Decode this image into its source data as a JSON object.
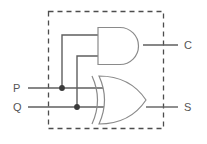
{
  "diagram": {
    "boundary": {
      "style": "dashed",
      "color": "#4d4d4d",
      "x": 48,
      "y": 11,
      "width": 115,
      "height": 117
    },
    "colors": {
      "wire": "#5f5f5f",
      "gate_outline": "#8a8a8a",
      "boundary": "#4d4d4d",
      "junction": "#3a3a3a",
      "label": "#555555",
      "background": "#ffffff"
    },
    "inputs": [
      {
        "id": "p",
        "label": "P",
        "x": 16,
        "y": 88
      },
      {
        "id": "q",
        "label": "Q",
        "x": 16,
        "y": 107
      }
    ],
    "outputs": [
      {
        "id": "c",
        "label": "C",
        "x": 188,
        "y": 45
      },
      {
        "id": "s",
        "label": "S",
        "x": 188,
        "y": 107
      }
    ],
    "gates": [
      {
        "id": "and-gate",
        "type": "AND",
        "function": "carry",
        "output": "C",
        "x": 97,
        "y": 27,
        "width": 46,
        "height": 37
      },
      {
        "id": "xor-gate",
        "type": "XOR",
        "function": "sum",
        "output": "S",
        "x": 92,
        "y": 75,
        "width": 54,
        "height": 50
      }
    ],
    "junctions": [
      {
        "id": "p-node",
        "on": "P",
        "x": 62,
        "y": 88
      },
      {
        "id": "q-node",
        "on": "Q",
        "x": 77,
        "y": 107
      }
    ],
    "connections": [
      {
        "from": "P",
        "to": "xor-gate.in1"
      },
      {
        "from": "P",
        "to": "and-gate.in1"
      },
      {
        "from": "Q",
        "to": "xor-gate.in2"
      },
      {
        "from": "Q",
        "to": "and-gate.in2"
      },
      {
        "from": "and-gate.out",
        "to": "C"
      },
      {
        "from": "xor-gate.out",
        "to": "S"
      }
    ]
  }
}
